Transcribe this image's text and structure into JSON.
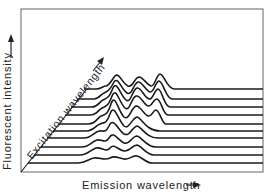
{
  "figure": {
    "type": "3D stacked fluorescence spectra (excitation-emission matrix)",
    "y_axis_label": "Fluorescent intensity",
    "x_axis_label": "Emission wavelength",
    "depth_axis_label": "Excitation wavelength",
    "arrow_glyph": "→",
    "line_color": "#1a1a1a",
    "frame_color": "#555555",
    "num_traces": 10
  }
}
